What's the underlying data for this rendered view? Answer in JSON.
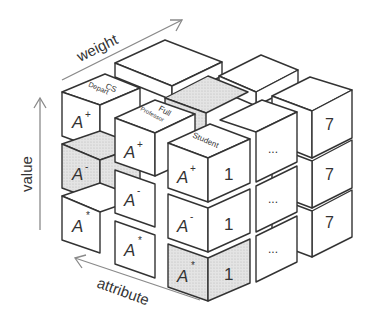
{
  "figure": {
    "axes": {
      "weight": "weight",
      "value": "value",
      "attribute": "attribute"
    },
    "colors": {
      "face": "#ffffff",
      "shaded": "#dcdcdc",
      "stroke": "#333333",
      "arrow": "#8a8a8a"
    },
    "top_labels": {
      "cs_depart_line1": "CS",
      "cs_depart_line2": "Depart",
      "full_professor_line1": "Full",
      "full_professor_line2": "Professor",
      "student": "Student"
    },
    "column_left": [
      "A+",
      "A-",
      "A*"
    ],
    "column_middle": [
      "A+",
      "A-",
      "A*"
    ],
    "column_front": [
      "A+",
      "A-",
      "A*"
    ],
    "front_side_values": [
      "1",
      "1",
      "1"
    ],
    "middle_side_values": [
      "...",
      "...",
      "..."
    ],
    "back_side_values": [
      "7",
      "7",
      "7"
    ],
    "cells": {
      "l0": "A",
      "l0s": "+",
      "l1": "A",
      "l1s": "-",
      "l2": "A",
      "l2s": "*",
      "m0": "A",
      "m0s": "+",
      "m1": "A",
      "m1s": "-",
      "m2": "A",
      "m2s": "*",
      "f0": "A",
      "f0s": "+",
      "f1": "A",
      "f1s": "-",
      "f2": "A",
      "f2s": "*",
      "r0": "1",
      "r1": "1",
      "r2": "1",
      "d0": "...",
      "d1": "...",
      "d2": "...",
      "s0": "7",
      "s1": "7",
      "s2": "7"
    }
  }
}
